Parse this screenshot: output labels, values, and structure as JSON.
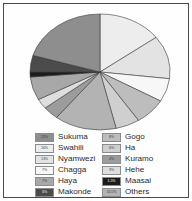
{
  "chart_data": {
    "type": "pie",
    "title": "",
    "subtitle": "",
    "xlabel": "",
    "ylabel": "",
    "legend_position": "bottom",
    "grid": false,
    "start_angle_deg": 0,
    "direction": "clockwise",
    "categories": [
      "Sukuma",
      "Swahili",
      "Nyamwezi",
      "Chagga",
      "Haya",
      "Makonde",
      "Gogo",
      "Ha",
      "Kuramo",
      "Hehe",
      "Maasai",
      "Others"
    ],
    "values": [
      22,
      16,
      13,
      7,
      7,
      5,
      8,
      6,
      4,
      3,
      1.5,
      15.5
    ],
    "value_labels": [
      "22%",
      "16%",
      "13%",
      "7%",
      "7%",
      "5%",
      "8%",
      "6%",
      "4%",
      "3%",
      "1.5%",
      "15.5%"
    ],
    "colors": [
      "#8e8e8e",
      "#ededed",
      "#e3e3e3",
      "#f7f7f7",
      "#a8a8a8",
      "#4b4b4b",
      "#bdbdbd",
      "#cfcfcf",
      "#9c9c9c",
      "#dedede",
      "#1c1c1c",
      "#b3b3b3"
    ],
    "slice_order": [
      "Swahili",
      "Nyamwezi",
      "Chagga",
      "Gogo",
      "Ha",
      "Others",
      "Kuramo",
      "Hehe",
      "Haya",
      "Maasai",
      "Makonde",
      "Sukuma"
    ]
  },
  "legend": {
    "left_column": [
      {
        "pct": "22%",
        "label": "Sukuma",
        "color": "#8e8e8e"
      },
      {
        "pct": "16%",
        "label": "Swahili",
        "color": "#ededed"
      },
      {
        "pct": "13%",
        "label": "Nyamwezi",
        "color": "#e3e3e3"
      },
      {
        "pct": "7%",
        "label": "Chagga",
        "color": "#f7f7f7"
      },
      {
        "pct": "7%",
        "label": "Haya",
        "color": "#a8a8a8"
      },
      {
        "pct": "5%",
        "label": "Makonde",
        "color": "#4b4b4b"
      }
    ],
    "right_column": [
      {
        "pct": "8%",
        "label": "Gogo",
        "color": "#bdbdbd"
      },
      {
        "pct": "6%",
        "label": "Ha",
        "color": "#cfcfcf"
      },
      {
        "pct": "4%",
        "label": "Kuramo",
        "color": "#9c9c9c"
      },
      {
        "pct": "3%",
        "label": "Hehe",
        "color": "#dedede"
      },
      {
        "pct": "1.5%",
        "label": "Maasai",
        "color": "#1c1c1c"
      },
      {
        "pct": "15.5%",
        "label": "Others",
        "color": "#b3b3b3"
      }
    ]
  },
  "style": {
    "frame_color": "#4a4a4a",
    "background": "#ffffff",
    "slice_stroke": "#3a3a3a"
  }
}
